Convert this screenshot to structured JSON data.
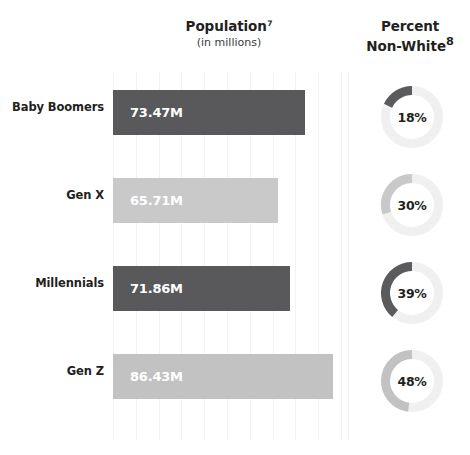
{
  "headers": {
    "population": {
      "title": "Population",
      "footnote": "7",
      "subtitle": "(in millions)"
    },
    "percent_non_white": {
      "line1": "Percent",
      "line2": "Non-White",
      "footnote": "8"
    }
  },
  "chart_data": {
    "type": "bar",
    "xlabel": "",
    "ylabel": "",
    "categories": [
      "Baby Boomers",
      "Gen X",
      "Millennials",
      "Gen Z"
    ],
    "values": [
      73.47,
      65.71,
      71.86,
      86.43
    ],
    "value_labels": [
      "73.47M",
      "65.71M",
      "71.86M",
      "86.43M"
    ],
    "bar_colors": [
      "#59595b",
      "#c9c9ca",
      "#59595b",
      "#c2c2c3"
    ],
    "xlim": [
      0,
      95
    ],
    "grid": true,
    "gridline_count": 10,
    "legend": "none",
    "secondary": {
      "type": "pie",
      "title": "Percent Non-White",
      "unit": "%",
      "categories": [
        "Baby Boomers",
        "Gen X",
        "Millennials",
        "Gen Z"
      ],
      "values": [
        18,
        30,
        39,
        48
      ],
      "value_labels": [
        "18%",
        "30%",
        "39%",
        "48%"
      ],
      "arc_colors": [
        "#5b5b5d",
        "#c9c9ca",
        "#5b5b5d",
        "#c2c2c3"
      ],
      "track_color": "#f0f0f0",
      "direction": "counterclockwise-from-top"
    }
  },
  "rows": [
    {
      "label": "Baby Boomers",
      "bar_value": "73.47M",
      "bar_width_px": 192,
      "bar_color": "#59595b",
      "donut_label": "18%",
      "donut_pct": 18,
      "donut_color": "#5b5b5d"
    },
    {
      "label": "Gen X",
      "bar_value": "65.71M",
      "bar_width_px": 165,
      "bar_color": "#c9c9ca",
      "donut_label": "30%",
      "donut_pct": 30,
      "donut_color": "#c9c9ca"
    },
    {
      "label": "Millennials",
      "bar_value": "71.86M",
      "bar_width_px": 177,
      "bar_color": "#59595b",
      "donut_label": "39%",
      "donut_pct": 39,
      "donut_color": "#5b5b5d"
    },
    {
      "label": "Gen Z",
      "bar_value": "86.43M",
      "bar_width_px": 220,
      "bar_color": "#c2c2c3",
      "donut_label": "48%",
      "donut_pct": 48,
      "donut_color": "#c2c2c3"
    }
  ],
  "style": {
    "background": "#ffffff",
    "gridline_color": "#f2f2f3",
    "divider_color": "#efefef",
    "donut_track_color": "#f0f0f0",
    "text_color": "#231f20",
    "bar_label_color": "#ffffff"
  }
}
